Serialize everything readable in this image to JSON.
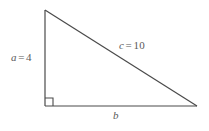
{
  "figure": {
    "name": "right-triangle-diagram",
    "background_color": "#ffffff",
    "stroke_color": "#4a4a4a",
    "label_color": "#5a5a5a",
    "labels": {
      "leg_a": {
        "variable": "a",
        "equals": "=",
        "value": "4",
        "full_text": "a = 4"
      },
      "hypotenuse_c": {
        "variable": "c",
        "equals": "=",
        "value": "10",
        "full_text": "c = 10"
      },
      "leg_b": {
        "variable": "b",
        "equals": "",
        "value": "",
        "full_text": "b"
      }
    },
    "geometry": {
      "apex": {
        "x": 45,
        "y": 10
      },
      "right_angle_vertex": {
        "x": 45,
        "y": 106
      },
      "base_right_vertex": {
        "x": 197,
        "y": 106
      },
      "right_angle_marker_size": 8
    }
  }
}
